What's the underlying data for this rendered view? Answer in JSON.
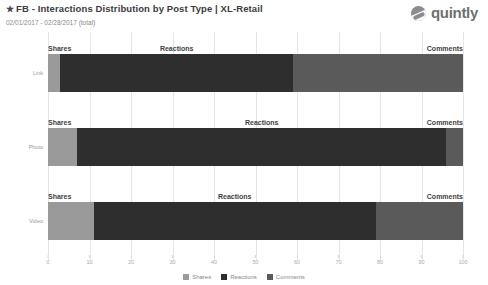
{
  "header": {
    "star_icon": "★",
    "title": "FB - Interactions Distribution by Post Type | XL-Retail",
    "subtitle": "02/01/2017 - 02/28/2017 (total)",
    "brand_name": "quintly",
    "brand_icon": "quintly-logo-icon"
  },
  "colors": {
    "shares": "#9a9a9a",
    "reactions": "#2e2e2e",
    "comments": "#5a5a5a",
    "grid": "#e6e6e6",
    "axis_text": "#aaaaaa",
    "label_text": "#3f3f3f",
    "row_label": "#9a9a9a",
    "title": "#3c3c3c",
    "subtitle": "#8a8a8a",
    "brand": "#6f6f6f"
  },
  "chart_data": {
    "type": "bar",
    "orientation": "horizontal",
    "stacked": true,
    "normalized": true,
    "title": "FB - Interactions Distribution by Post Type | XL-Retail",
    "subtitle": "02/01/2017 - 02/28/2017 (total)",
    "xlabel": "",
    "ylabel": "",
    "xlim": [
      0,
      100
    ],
    "grid": true,
    "legend_position": "bottom",
    "categories": [
      "Link",
      "Photo",
      "Video"
    ],
    "tick_labels": [
      "0",
      "10",
      "20",
      "30",
      "40",
      "50",
      "60",
      "70",
      "80",
      "90",
      "100"
    ],
    "tick_values": [
      0,
      10,
      20,
      30,
      40,
      50,
      60,
      70,
      80,
      90,
      100
    ],
    "series": [
      {
        "name": "Shares",
        "color": "#9a9a9a",
        "values": [
          3,
          7,
          11
        ]
      },
      {
        "name": "Reactions",
        "color": "#2e2e2e",
        "values": [
          56,
          89,
          68
        ]
      },
      {
        "name": "Comments",
        "color": "#5a5a5a",
        "values": [
          41,
          4,
          21
        ]
      }
    ],
    "rows": [
      {
        "category": "Link",
        "segments": [
          {
            "name": "Shares",
            "label": "Shares",
            "start": 0,
            "end": 3,
            "value": 3,
            "label_align": "left",
            "color": "#9a9a9a"
          },
          {
            "name": "Reactions",
            "label": "Reactions",
            "start": 3,
            "end": 59,
            "value": 56,
            "label_align": "center",
            "color": "#2e2e2e"
          },
          {
            "name": "Comments",
            "label": "Comments",
            "start": 59,
            "end": 100,
            "value": 41,
            "label_align": "right",
            "color": "#5a5a5a"
          }
        ]
      },
      {
        "category": "Photo",
        "segments": [
          {
            "name": "Shares",
            "label": "Shares",
            "start": 0,
            "end": 7,
            "value": 7,
            "label_align": "left",
            "color": "#9a9a9a"
          },
          {
            "name": "Reactions",
            "label": "Reactions",
            "start": 7,
            "end": 96,
            "value": 89,
            "label_align": "center",
            "color": "#2e2e2e"
          },
          {
            "name": "Comments",
            "label": "Comments",
            "start": 96,
            "end": 100,
            "value": 4,
            "label_align": "right",
            "color": "#5a5a5a"
          }
        ]
      },
      {
        "category": "Video",
        "segments": [
          {
            "name": "Shares",
            "label": "Shares",
            "start": 0,
            "end": 11,
            "value": 11,
            "label_align": "left",
            "color": "#9a9a9a"
          },
          {
            "name": "Reactions",
            "label": "Reactions",
            "start": 11,
            "end": 79,
            "value": 68,
            "label_align": "center",
            "color": "#2e2e2e"
          },
          {
            "name": "Comments",
            "label": "Comments",
            "start": 79,
            "end": 100,
            "value": 21,
            "label_align": "right",
            "color": "#5a5a5a"
          }
        ]
      }
    ],
    "legend": [
      {
        "label": "Shares",
        "color": "#9a9a9a"
      },
      {
        "label": "Reactions",
        "color": "#2e2e2e"
      },
      {
        "label": "Comments",
        "color": "#5a5a5a"
      }
    ]
  }
}
